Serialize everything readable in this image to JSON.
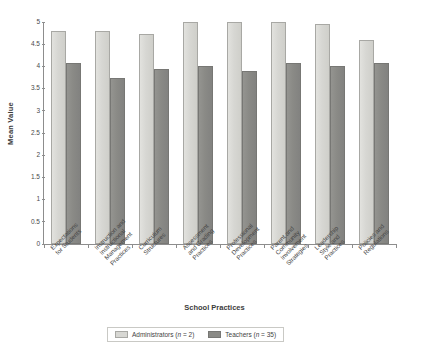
{
  "chart_data": {
    "type": "bar",
    "title": "",
    "xlabel": "School Practices",
    "ylabel": "Mean Value",
    "ylim": [
      0,
      5
    ],
    "ytick_labels": [
      "5",
      "4.5",
      "4",
      "3.5",
      "3",
      "2.5",
      "2",
      "1.5",
      "1",
      "0.5",
      "0"
    ],
    "ytick_values": [
      5,
      4.5,
      4,
      3.5,
      3,
      2.5,
      2,
      1.5,
      1,
      0.5,
      0
    ],
    "grid": false,
    "legend_position": "bottom-center",
    "categories": [
      "Expectations\nfor Students",
      "Instruction and\nInstructional\nManagement\nPractices",
      "Curriculum\nStructures",
      "Assessment\nand Grading\nPractices",
      "Professional\nDevelopment\nPractices",
      "Parent and\nCommunity\nInvolvement\nStrategies",
      "Leadership\nStyle and\nPractices",
      "Policies and\nRegulations"
    ],
    "series": [
      {
        "name": "Administrators (n = 2)",
        "color": "#d7d7d3",
        "values": [
          4.8,
          4.8,
          4.73,
          5.0,
          5.0,
          5.0,
          4.95,
          4.6
        ]
      },
      {
        "name": "Teachers (n = 35)",
        "color": "#8a8a86",
        "values": [
          4.07,
          3.73,
          3.95,
          4.0,
          3.9,
          4.07,
          4.0,
          4.07
        ]
      }
    ]
  },
  "legend": {
    "entries": [
      {
        "label_prefix": "Administrators (",
        "label_italic": "n",
        "label_suffix": " = 2)"
      },
      {
        "label_prefix": "Teachers (",
        "label_italic": "n",
        "label_suffix": " = 35)"
      }
    ]
  }
}
